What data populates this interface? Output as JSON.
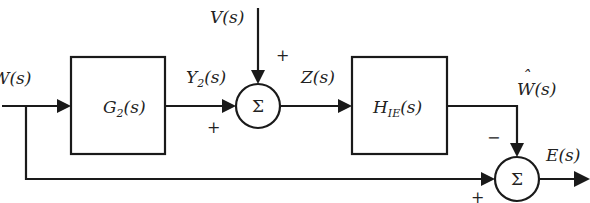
{
  "diagram": {
    "type": "block-diagram",
    "signals": {
      "input": "W(s)",
      "disturbance": "V(s)",
      "g2_output": "Y₂(s)",
      "sum_output": "Z(s)",
      "estimate": "Ŵ(s)",
      "error": "E(s)"
    },
    "labels": {
      "w_in": {
        "main": "W(s)"
      },
      "v_in": {
        "main": "V(s)"
      },
      "y2": {
        "base": "Y",
        "sub": "2",
        "rest": "(s)"
      },
      "z": {
        "main": "Z(s)"
      },
      "w_hat": {
        "base": "W",
        "hat": "ˆ",
        "rest": "(s)"
      },
      "e": {
        "main": "E(s)"
      }
    },
    "blocks": [
      {
        "id": "g2",
        "base": "G",
        "sub": "2",
        "rest": "(s)"
      },
      {
        "id": "hie",
        "base": "H",
        "sub": "IE",
        "rest": "(s)"
      }
    ],
    "summers": [
      {
        "id": "sum1",
        "symbol": "Σ",
        "signs": {
          "top": "+",
          "left": "+"
        }
      },
      {
        "id": "sum2",
        "symbol": "Σ",
        "signs": {
          "top": "−",
          "left": "+"
        }
      }
    ]
  }
}
